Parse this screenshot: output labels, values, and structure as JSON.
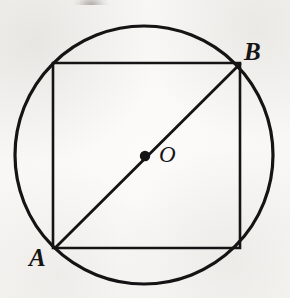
{
  "figure": {
    "background_color": "#f7f6f4",
    "stroke_color": "#141414",
    "canvas": {
      "width": 290,
      "height": 298
    },
    "circle": {
      "name": "circumscribed-circle",
      "center_x": 144,
      "center_y": 155,
      "radius": 129,
      "stroke_width": 3.2
    },
    "square": {
      "name": "inscribed-square",
      "left": 53,
      "top": 63,
      "right": 240,
      "bottom": 248,
      "stroke_width": 2.6,
      "vertices": [
        {
          "x": 53,
          "y": 63
        },
        {
          "x": 240,
          "y": 63
        },
        {
          "x": 240,
          "y": 248
        },
        {
          "x": 53,
          "y": 248
        }
      ]
    },
    "diagonal": {
      "name": "diagonal-AB",
      "x1": 55,
      "y1": 248,
      "x2": 240,
      "y2": 64,
      "stroke_width": 2.8
    },
    "center_dot": {
      "name": "center-point-O",
      "x": 145,
      "y": 156,
      "radius": 5.2
    },
    "labels": {
      "a": "A",
      "b": "B",
      "o": "O"
    }
  }
}
